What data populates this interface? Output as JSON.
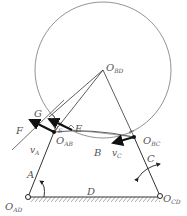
{
  "diagram": {
    "type": "four-bar linkage velocity diagram",
    "colors": {
      "line": "#333333",
      "circle": "#666666",
      "label": "#555555",
      "arrow": "#111111"
    },
    "points": {
      "O_BD": {
        "label": "O",
        "sub": "BD"
      },
      "O_AB": {
        "label": "O",
        "sub": "AB"
      },
      "O_BC": {
        "label": "O",
        "sub": "BC"
      },
      "O_AD": {
        "label": "O",
        "sub": "AD"
      },
      "O_CD": {
        "label": "O",
        "sub": "CD"
      },
      "E": {
        "label": "E"
      },
      "F": {
        "label": "F"
      },
      "G": {
        "label": "G"
      },
      "B": {
        "label": "B"
      }
    },
    "links": {
      "A": {
        "label": "A"
      },
      "C": {
        "label": "C"
      },
      "D": {
        "label": "D"
      }
    },
    "velocities": {
      "vA": {
        "label": "v",
        "sub": "A"
      },
      "vE": {
        "label": "v",
        "sub": "E"
      },
      "vC": {
        "label": "v",
        "sub": "C"
      }
    }
  }
}
